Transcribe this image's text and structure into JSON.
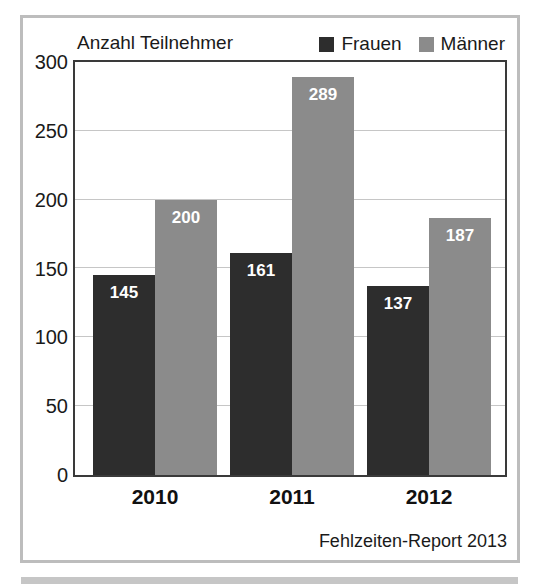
{
  "figure": {
    "source_label": "Fehlzeiten-Report 2013"
  },
  "chart_data": {
    "type": "bar",
    "title": "Anzahl Teilnehmer",
    "categories": [
      "2010",
      "2011",
      "2012"
    ],
    "series": [
      {
        "name": "Frauen",
        "color": "#2d2d2d",
        "value_label_color": "#ffffff",
        "values": [
          145,
          161,
          137
        ]
      },
      {
        "name": "Männer",
        "color": "#8b8b8b",
        "value_label_color": "#ffffff",
        "values": [
          200,
          289,
          187
        ]
      }
    ],
    "ylim": [
      0,
      300
    ],
    "yticks": [
      0,
      50,
      100,
      150,
      200,
      250,
      300
    ],
    "grid": true,
    "gridline_color": "#c6c6c6",
    "legend_position": "top-right",
    "value_labels": "inside-top",
    "frame_border_color": "#bdbdbd",
    "plot_border_color": "#3a3a3a"
  }
}
